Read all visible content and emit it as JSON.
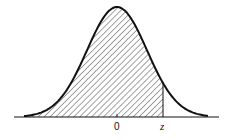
{
  "figure": {
    "curve": "normal-density",
    "shaded_region": "from left tail to z",
    "hatch": "diagonal lines",
    "colors": {
      "stroke": "#111111",
      "hatch": "#333333",
      "background": "#ffffff"
    }
  },
  "axis": {
    "labels": [
      {
        "id": "zero",
        "text": "0"
      },
      {
        "id": "z",
        "text": "z"
      }
    ]
  }
}
